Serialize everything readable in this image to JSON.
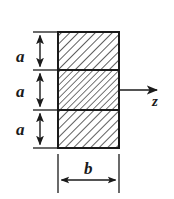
{
  "figure": {
    "kind": "engineering-cross-section-diagram",
    "background_color": "#ffffff",
    "line_color": "#1a1a1a",
    "hatch_color": "#2b2b2b",
    "labels": {
      "a_top": "a",
      "a_middle": "a",
      "a_bottom": "a",
      "b": "b",
      "z": "z"
    },
    "geometry": {
      "rect_left": 58,
      "rect_right": 119,
      "rect_top": 32,
      "rect_bottom": 148,
      "divider_1_y": 70,
      "divider_2_y": 110,
      "z_axis_y": 90,
      "z_axis_tip_x": 158,
      "b_dimension_y": 180,
      "vertical_dimension_x": 37,
      "width_b": 61,
      "strip_height_a": 38.7
    },
    "annotations": {
      "strip_count": 3,
      "strips_equal": true,
      "hatch_direction": "backslash",
      "z_axis_direction": "right",
      "z_axis_origin": "centroid of middle strip right edge"
    }
  }
}
